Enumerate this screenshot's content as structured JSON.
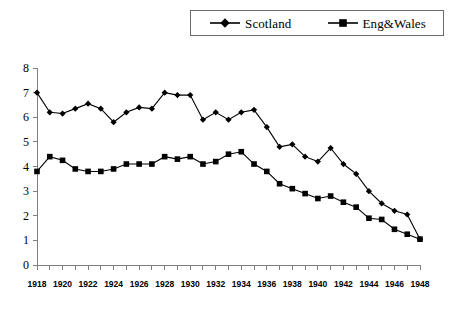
{
  "chart_data": {
    "type": "line",
    "title": "",
    "subtitle": "",
    "xlabel": "",
    "ylabel": "",
    "xlim": [
      1918,
      1948
    ],
    "ylim": [
      0,
      8
    ],
    "grid": false,
    "legend_position": "top-right",
    "y_ticks": [
      "0",
      "1",
      "2",
      "3",
      "4",
      "5",
      "6",
      "7",
      "8"
    ],
    "x_tick_labels": [
      "1918",
      "1920",
      "1922",
      "1924",
      "1926",
      "1928",
      "1930",
      "1932",
      "1934",
      "1936",
      "1938",
      "1940",
      "1942",
      "1944",
      "1946",
      "1948"
    ],
    "x": [
      1918,
      1919,
      1920,
      1921,
      1922,
      1923,
      1924,
      1925,
      1926,
      1927,
      1928,
      1929,
      1930,
      1931,
      1932,
      1933,
      1934,
      1935,
      1936,
      1937,
      1938,
      1939,
      1940,
      1941,
      1942,
      1943,
      1944,
      1945,
      1946,
      1947,
      1948
    ],
    "series": [
      {
        "name": "Scotland",
        "marker": "diamond",
        "color": "#000000",
        "values": [
          7.0,
          6.2,
          6.15,
          6.35,
          6.55,
          6.35,
          5.8,
          6.2,
          6.4,
          6.35,
          7.0,
          6.9,
          6.9,
          5.9,
          6.2,
          5.9,
          6.2,
          6.3,
          5.6,
          4.8,
          4.9,
          4.4,
          4.2,
          4.75,
          4.1,
          3.7,
          3.0,
          2.5,
          2.2,
          2.05,
          1.05
        ]
      },
      {
        "name": "Eng&Wales",
        "marker": "square",
        "color": "#000000",
        "values": [
          3.8,
          4.4,
          4.25,
          3.9,
          3.8,
          3.8,
          3.9,
          4.1,
          4.1,
          4.1,
          4.4,
          4.3,
          4.4,
          4.1,
          4.2,
          4.5,
          4.6,
          4.1,
          3.8,
          3.3,
          3.1,
          2.9,
          2.7,
          2.8,
          2.55,
          2.35,
          1.9,
          1.85,
          1.45,
          1.25,
          1.05
        ]
      }
    ]
  },
  "legend": {
    "items": [
      {
        "label": "Scotland",
        "marker": "diamond"
      },
      {
        "label": "Eng&Wales",
        "marker": "square"
      }
    ]
  }
}
